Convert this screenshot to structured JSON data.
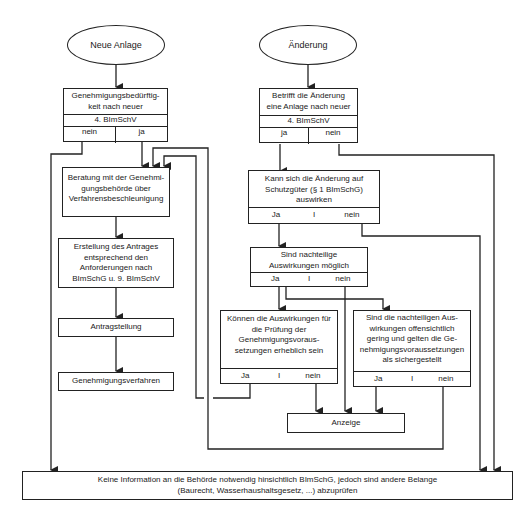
{
  "diagram": {
    "start_left": "Neue Anlage",
    "start_right": "Änderung",
    "left": {
      "decision1": {
        "text": "Genehmigungsbedürftig-keit nach neuer",
        "line1": "Genehmigungsbedürftig-",
        "line2": "keit nach neuer",
        "sub": "4. BImSchV",
        "opt_a": "nein",
        "opt_b": "ja"
      },
      "step1": {
        "line1": "Beratung mit der Genehmi-",
        "line2": "gungsbehörde über",
        "line3": "Verfahrensbeschleunigung"
      },
      "step2": {
        "line1": "Erstellung des Antrages",
        "line2": "entsprechend den",
        "line3": "Anforderungen nach",
        "line4": "BImSchG u. 9. BImSchV"
      },
      "step3": "Antragstellung",
      "step4": "Genehmigungsverfahren"
    },
    "right": {
      "decision1": {
        "line1": "Betrifft die Änderung",
        "line2": "eine Anlage nach neuer",
        "sub": "4. BImSchV",
        "opt_a": "ja",
        "opt_b": "nein"
      },
      "decision2": {
        "line1": "Kann  sich die Änderung auf",
        "line2": "Schutzgüter (§ 1 BImSchG)",
        "line3": "auswirken",
        "opt_a": "Ja",
        "sep": "I",
        "opt_b": "nein"
      },
      "decision3": {
        "line1": "Sind nachteilige",
        "line2": "Auswirkungen möglich",
        "opt_a": "Ja",
        "sep": "I",
        "opt_b": "nein"
      },
      "decision4": {
        "line1": "Können die Auswirkungen für",
        "line2": "die Prüfung der",
        "line3": "Genehmigungsvoraus-",
        "line4": "setzungen erheblich sein",
        "opt_a": "Ja",
        "sep": "I",
        "opt_b": "nein"
      },
      "decision5": {
        "line1": "Sind die nachteiligen Aus-",
        "line2": "wirkungen offensichtlich",
        "line3": "gering und gelten die Ge-",
        "line4": "nehmigungsvoraussetzungen",
        "line5": "als sichergestellt",
        "opt_a": "Ja",
        "sep": "I",
        "opt_b": "nein"
      },
      "anzeige": "Anzeige"
    },
    "bottom": {
      "line1": "Keine Information an die Behörde notwendig hinsichtlich BImSchG, jedoch sind andere Belange",
      "line2": "(Baurecht, Wasserhaushaltsgesetz, ...) abzuprüfen"
    }
  },
  "colors": {
    "line": "#222222",
    "background": "#ffffff",
    "text": "#1a1a1a"
  }
}
